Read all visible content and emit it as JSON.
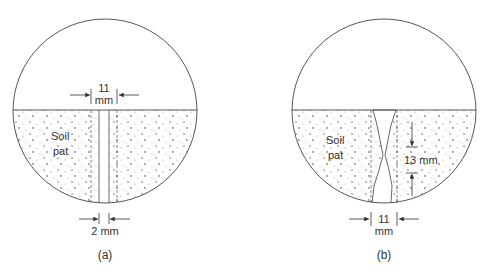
{
  "panels": [
    {
      "id": "a",
      "caption": "(a)",
      "soil_label_1": "Soil",
      "soil_label_2": "pat",
      "top_dim_value": "11",
      "top_dim_unit": "mm",
      "bottom_dim": "2 mm"
    },
    {
      "id": "b",
      "caption": "(b)",
      "soil_label_1": "Soil",
      "soil_label_2": "pat",
      "side_dim": "13 mm",
      "bottom_dim_value": "11",
      "bottom_dim_unit": "mm"
    }
  ],
  "colors": {
    "line": "#444444",
    "dots": "#555555",
    "text": "#333333"
  }
}
